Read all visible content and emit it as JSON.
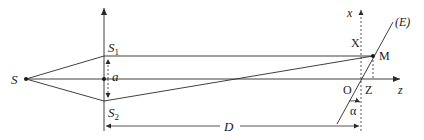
{
  "diagram": {
    "type": "young-double-slit-geometry",
    "labels": {
      "source": "S",
      "slit1": "S",
      "slit1_sub": "1",
      "slit2": "S",
      "slit2_sub": "2",
      "slit_separation": "a",
      "distance": "D",
      "x_axis": "x",
      "z_axis": "z",
      "screen": "(E)",
      "point": "M",
      "x_coord": "X",
      "z_coord": "Z",
      "origin": "O",
      "angle": "α"
    },
    "colors": {
      "line": "#2a2a2a",
      "background": "#ffffff"
    }
  }
}
